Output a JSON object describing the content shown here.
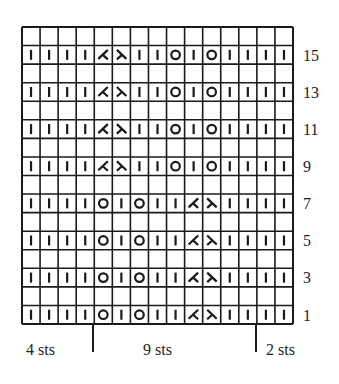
{
  "chart": {
    "columns": 15,
    "rows": 16,
    "legend_symbols": {
      "I": "knit-stitch",
      "O": "yarn-over",
      "L": "left-leaning-decrease",
      "R": "right-leaning-decrease",
      "": "blank"
    },
    "grid": [
      [
        "",
        "",
        "",
        "",
        "",
        "",
        "",
        "",
        "",
        "",
        "",
        "",
        "",
        "",
        ""
      ],
      [
        "I",
        "I",
        "I",
        "I",
        "L",
        "R",
        "I",
        "I",
        "O",
        "I",
        "O",
        "I",
        "I",
        "I",
        "I"
      ],
      [
        "",
        "",
        "",
        "",
        "",
        "",
        "",
        "",
        "",
        "",
        "",
        "",
        "",
        "",
        ""
      ],
      [
        "I",
        "I",
        "I",
        "I",
        "L",
        "R",
        "I",
        "I",
        "O",
        "I",
        "O",
        "I",
        "I",
        "I",
        "I"
      ],
      [
        "",
        "",
        "",
        "",
        "",
        "",
        "",
        "",
        "",
        "",
        "",
        "",
        "",
        "",
        ""
      ],
      [
        "I",
        "I",
        "I",
        "I",
        "L",
        "R",
        "I",
        "I",
        "O",
        "I",
        "O",
        "I",
        "I",
        "I",
        "I"
      ],
      [
        "",
        "",
        "",
        "",
        "",
        "",
        "",
        "",
        "",
        "",
        "",
        "",
        "",
        "",
        ""
      ],
      [
        "I",
        "I",
        "I",
        "I",
        "L",
        "R",
        "I",
        "I",
        "O",
        "I",
        "O",
        "I",
        "I",
        "I",
        "I"
      ],
      [
        "",
        "",
        "",
        "",
        "",
        "",
        "",
        "",
        "",
        "",
        "",
        "",
        "",
        "",
        ""
      ],
      [
        "I",
        "I",
        "I",
        "I",
        "O",
        "I",
        "O",
        "I",
        "I",
        "L",
        "R",
        "I",
        "I",
        "I",
        "I"
      ],
      [
        "",
        "",
        "",
        "",
        "",
        "",
        "",
        "",
        "",
        "",
        "",
        "",
        "",
        "",
        ""
      ],
      [
        "I",
        "I",
        "I",
        "I",
        "O",
        "I",
        "O",
        "I",
        "I",
        "L",
        "R",
        "I",
        "I",
        "I",
        "I"
      ],
      [
        "",
        "",
        "",
        "",
        "",
        "",
        "",
        "",
        "",
        "",
        "",
        "",
        "",
        "",
        ""
      ],
      [
        "I",
        "I",
        "I",
        "I",
        "O",
        "I",
        "O",
        "I",
        "I",
        "L",
        "R",
        "I",
        "I",
        "I",
        "I"
      ],
      [
        "",
        "",
        "",
        "",
        "",
        "",
        "",
        "",
        "",
        "",
        "",
        "",
        "",
        "",
        ""
      ],
      [
        "I",
        "I",
        "I",
        "I",
        "O",
        "I",
        "O",
        "I",
        "I",
        "L",
        "R",
        "I",
        "I",
        "I",
        "I"
      ]
    ],
    "row_numbers": [
      {
        "label": "15",
        "row_index": 1
      },
      {
        "label": "13",
        "row_index": 3
      },
      {
        "label": "11",
        "row_index": 5
      },
      {
        "label": "9",
        "row_index": 7
      },
      {
        "label": "7",
        "row_index": 9
      },
      {
        "label": "5",
        "row_index": 11
      },
      {
        "label": "3",
        "row_index": 13
      },
      {
        "label": "1",
        "row_index": 15
      }
    ]
  },
  "repeat_labels": {
    "left": "4 sts",
    "middle": "9 sts",
    "right": "2 sts"
  },
  "colors": {
    "ink": "#1a1a1a",
    "paper": "#ffffff"
  }
}
